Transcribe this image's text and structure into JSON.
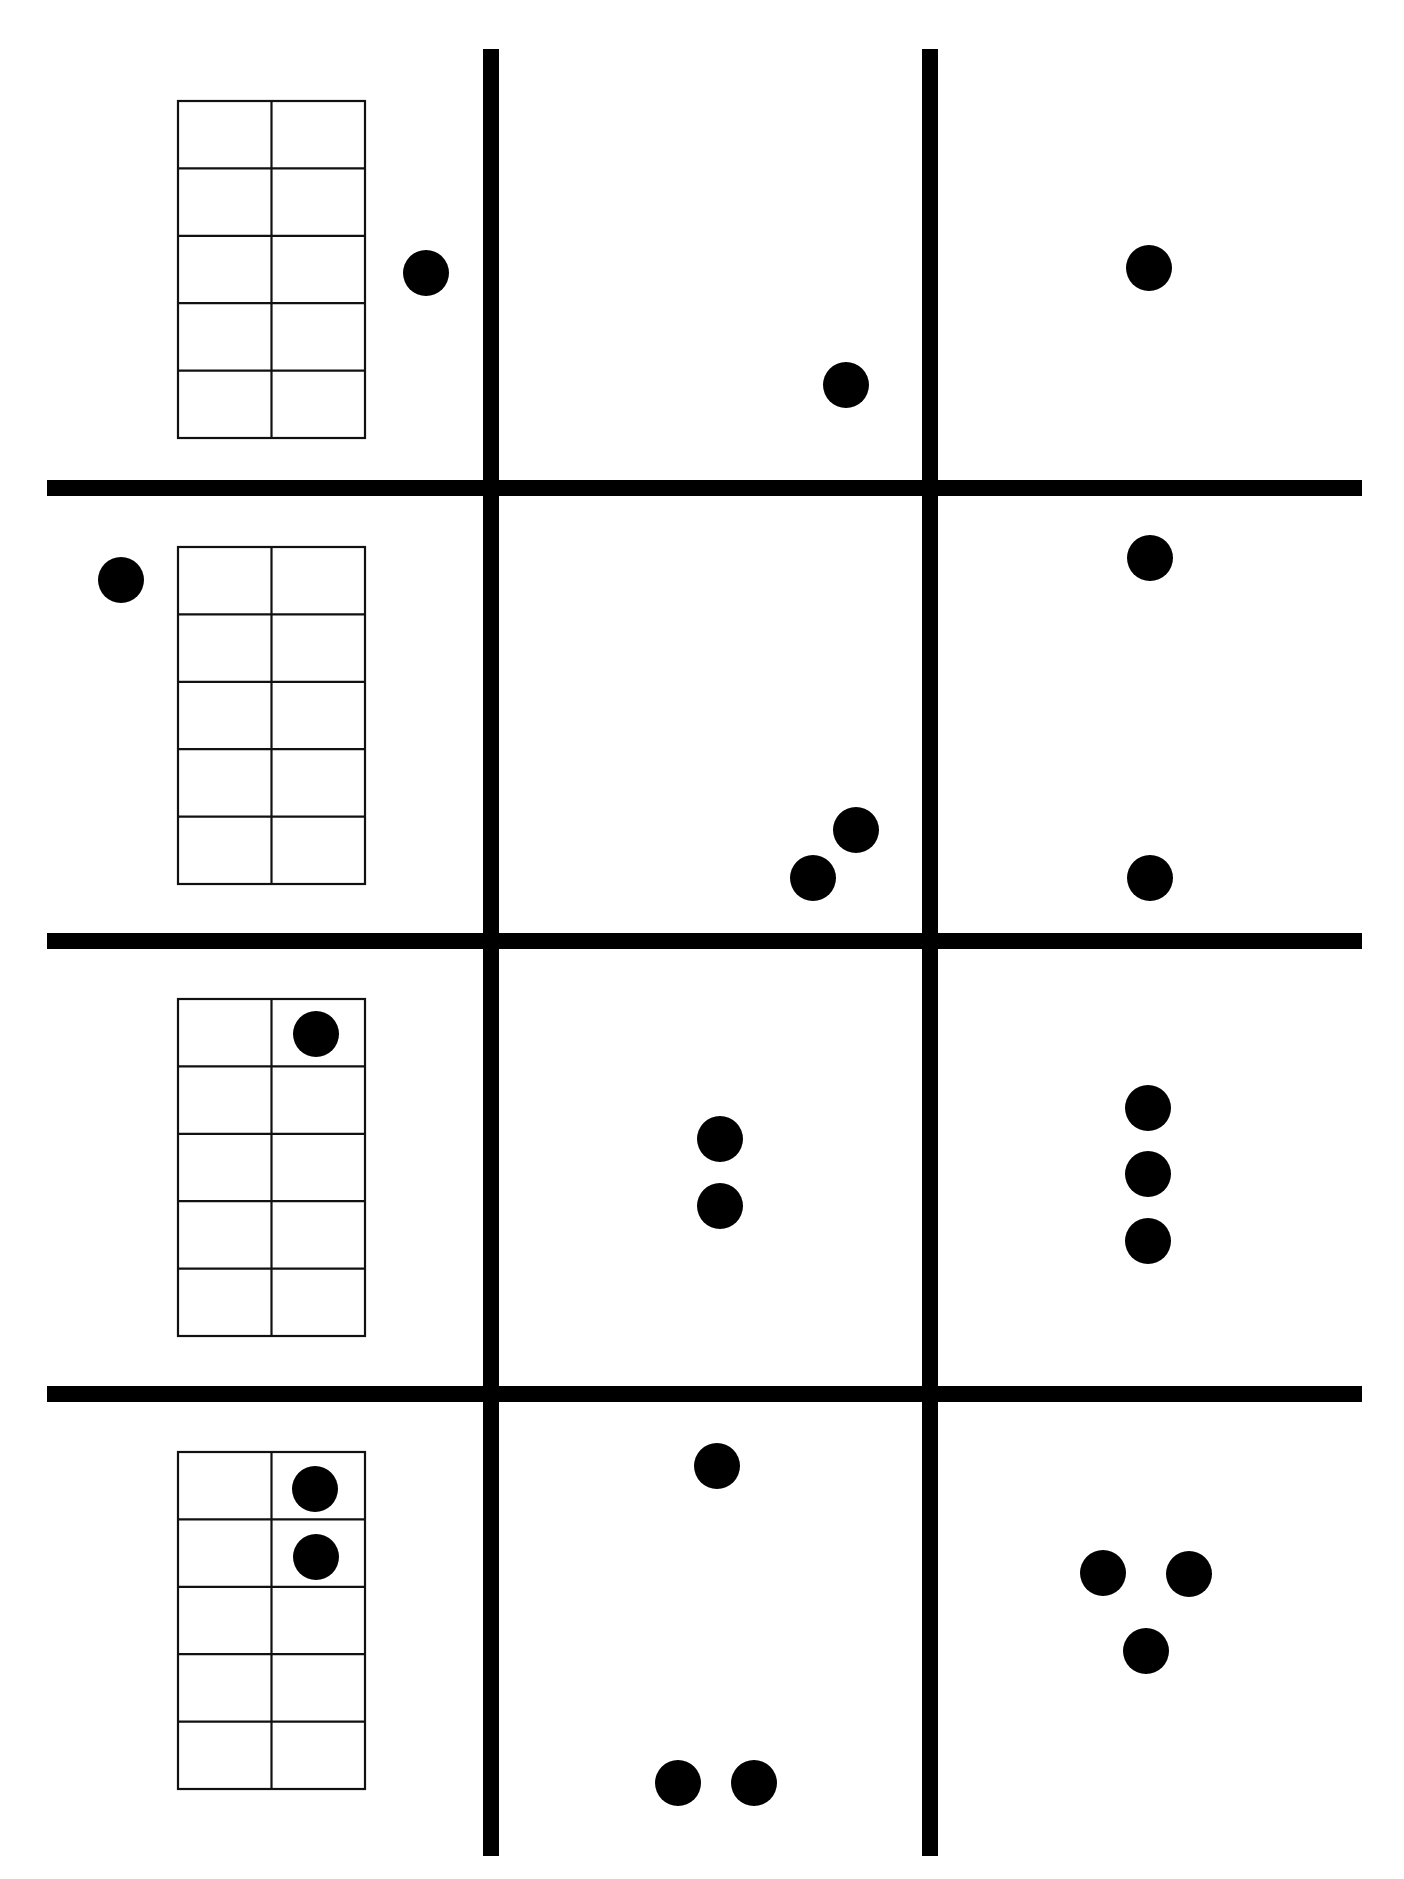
{
  "worksheet": {
    "title": "Ten-frame and dot-pattern matching grid",
    "background_color": "#ffffff",
    "ink_color": "#000000",
    "grid": {
      "rows": 4,
      "cols": 3,
      "outer": {
        "x1": 47,
        "y1": 49,
        "x2": 1362,
        "y2": 1856,
        "stroke": 16
      },
      "col_dividers_x": [
        491,
        930
      ],
      "row_dividers_y": [
        488,
        941,
        1394
      ],
      "divider_stroke": 16
    },
    "ten_frame": {
      "columns": 2,
      "rows": 5,
      "x": 178,
      "width": 187,
      "height": 337
    },
    "dot_radius": 23,
    "rows": [
      {
        "label": "Row 1",
        "ten_frame": {
          "y": 101,
          "filled_cells": []
        },
        "cells": [
          {
            "col": 0,
            "type": "ten-frame-with-dots",
            "count": 1,
            "dots": [
              [
                426,
                273
              ]
            ]
          },
          {
            "col": 1,
            "type": "dot-pattern",
            "count": 1,
            "dots": [
              [
                846,
                385
              ]
            ]
          },
          {
            "col": 2,
            "type": "dot-pattern",
            "count": 1,
            "dots": [
              [
                1149,
                268
              ]
            ]
          }
        ]
      },
      {
        "label": "Row 2",
        "ten_frame": {
          "y": 547,
          "filled_cells": []
        },
        "cells": [
          {
            "col": 0,
            "type": "ten-frame-with-dots",
            "count": 1,
            "dots": [
              [
                121,
                580
              ]
            ]
          },
          {
            "col": 1,
            "type": "dot-pattern",
            "count": 2,
            "dots": [
              [
                856,
                830
              ],
              [
                813,
                878
              ]
            ]
          },
          {
            "col": 2,
            "type": "dot-pattern",
            "count": 2,
            "dots": [
              [
                1150,
                558
              ],
              [
                1150,
                878
              ]
            ]
          }
        ]
      },
      {
        "label": "Row 3",
        "ten_frame": {
          "y": 999,
          "filled_cells": [
            [
              0,
              1
            ]
          ]
        },
        "cells": [
          {
            "col": 0,
            "type": "ten-frame-with-dots",
            "count": 1,
            "dots": [
              [
                316,
                1034
              ]
            ]
          },
          {
            "col": 1,
            "type": "dot-pattern",
            "count": 2,
            "dots": [
              [
                720,
                1139
              ],
              [
                720,
                1206
              ]
            ]
          },
          {
            "col": 2,
            "type": "dot-pattern",
            "count": 3,
            "dots": [
              [
                1148,
                1108
              ],
              [
                1148,
                1174
              ],
              [
                1148,
                1241
              ]
            ]
          }
        ]
      },
      {
        "label": "Row 4",
        "ten_frame": {
          "y": 1452,
          "filled_cells": [
            [
              0,
              1
            ],
            [
              1,
              1
            ]
          ]
        },
        "cells": [
          {
            "col": 0,
            "type": "ten-frame-with-dots",
            "count": 2,
            "dots": [
              [
                315,
                1489
              ],
              [
                316,
                1557
              ]
            ]
          },
          {
            "col": 1,
            "type": "dot-pattern",
            "count": 3,
            "dots": [
              [
                717,
                1466
              ],
              [
                678,
                1783
              ],
              [
                754,
                1783
              ]
            ]
          },
          {
            "col": 2,
            "type": "dot-pattern",
            "count": 3,
            "dots": [
              [
                1103,
                1573
              ],
              [
                1189,
                1574
              ],
              [
                1146,
                1651
              ]
            ]
          }
        ]
      }
    ]
  }
}
